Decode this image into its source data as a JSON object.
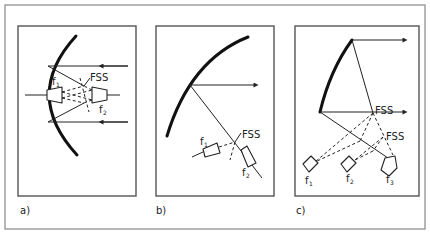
{
  "figure": {
    "panels": [
      {
        "id": "a",
        "label": "a)",
        "fss_label": "FSS",
        "feeds": [
          {
            "name": "f",
            "sub": "1"
          },
          {
            "name": "f",
            "sub": "2"
          }
        ]
      },
      {
        "id": "b",
        "label": "b)",
        "fss_label": "FSS",
        "feeds": [
          {
            "name": "f",
            "sub": "1"
          },
          {
            "name": "f",
            "sub": "2"
          }
        ]
      },
      {
        "id": "c",
        "label": "c)",
        "fss_labels": [
          "FSS",
          "FSS"
        ],
        "feeds": [
          {
            "name": "f",
            "sub": "1"
          },
          {
            "name": "f",
            "sub": "2"
          },
          {
            "name": "f",
            "sub": "3"
          }
        ]
      }
    ]
  },
  "colors": {
    "ink": "#222222",
    "frame": "#555555",
    "background": "#ffffff"
  }
}
